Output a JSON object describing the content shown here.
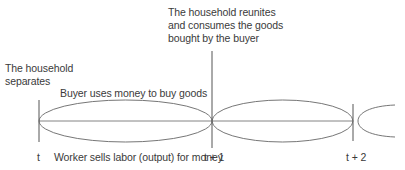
{
  "diagram": {
    "labels": {
      "separates": "The household\nseparates",
      "reunites": "The household reunites\nand consumes the goods\nbought by the buyer",
      "buyer": "Buyer uses money to buy goods",
      "worker": "Worker sells labor (output) for money"
    },
    "time_marks": {
      "t0": "t",
      "t1": "t + 1",
      "t2": "t + 2"
    },
    "colors": {
      "line": "#555555",
      "text": "#3a3a3a",
      "background": "#ffffff"
    }
  }
}
